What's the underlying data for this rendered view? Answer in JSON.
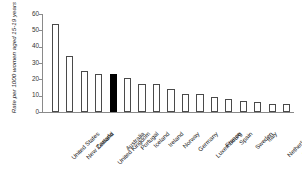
{
  "chart_data": {
    "type": "bar",
    "title": "",
    "xlabel": "",
    "ylabel": "Rate per 1000 women aged 15-19 years",
    "ylim": [
      0,
      60
    ],
    "yticks": [
      0,
      10,
      20,
      30,
      40,
      50,
      60
    ],
    "grid": false,
    "legend": null,
    "highlight_color": "#000000",
    "bar_color": "#ffffff",
    "bar_edge_color": "#4a4a4a",
    "highlighted_category": "Australia",
    "categories": [
      "United States",
      "New Zealand",
      "Canada",
      "United Kingdom",
      "Australia",
      "Portugal",
      "Iceland",
      "Ireland",
      "Norway",
      "Germany",
      "Luxembourg",
      "France",
      "Spain",
      "Sweden",
      "Italy",
      "Netherlands",
      "Switzerland"
    ],
    "values": [
      54,
      34,
      25,
      23,
      23,
      21,
      17,
      17,
      14,
      11,
      11,
      9,
      8,
      7,
      6,
      5,
      5
    ],
    "highlight_flags": [
      false,
      false,
      false,
      false,
      true,
      false,
      false,
      false,
      false,
      false,
      false,
      false,
      false,
      false,
      false,
      false,
      false
    ]
  }
}
